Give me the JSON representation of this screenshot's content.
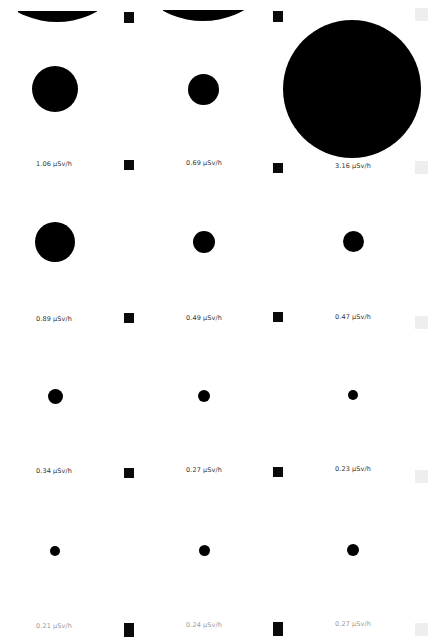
{
  "sheet": {
    "background": "#ffffff",
    "dot_color": "#000000",
    "unit": "µSv/h",
    "top_partial_dots": [
      {
        "clip": {
          "left": 18,
          "top": 11,
          "width": 79,
          "height": 12
        },
        "cx": 57,
        "cy": -60,
        "d": 164
      },
      {
        "clip": {
          "left": 163,
          "top": 10,
          "width": 81,
          "height": 12
        },
        "cx": 203,
        "cy": -62,
        "d": 166
      }
    ],
    "rows": [
      {
        "cells": [
          {
            "value": "1.06 µSv/h",
            "cx": 55,
            "cy": 89,
            "d": 46,
            "label_x": 36,
            "label_y": 160
          },
          {
            "value": "0.69 µSv/h",
            "cx": 203,
            "cy": 89,
            "d": 31,
            "label_x": 186,
            "label_y": 159
          },
          {
            "value": "3.16 µSv/h",
            "cx": 352,
            "cy": 89,
            "d": 138,
            "label_x": 335,
            "label_y": 162
          }
        ]
      },
      {
        "cells": [
          {
            "value": "0.89 µSv/h",
            "cx": 55,
            "cy": 242,
            "d": 40,
            "label_x": 36,
            "label_y": 315
          },
          {
            "value": "0.49 µSv/h",
            "cx": 204,
            "cy": 242,
            "d": 22,
            "label_x": 186,
            "label_y": 314
          },
          {
            "value": "0.47 µSv/h",
            "cx": 353,
            "cy": 241,
            "d": 21,
            "label_x": 335,
            "label_y": 313
          }
        ]
      },
      {
        "cells": [
          {
            "value": "0.34 µSv/h",
            "cx": 55,
            "cy": 396,
            "d": 15,
            "label_x": 36,
            "label_y": 467
          },
          {
            "value": "0.27 µSv/h",
            "cx": 204,
            "cy": 396,
            "d": 12,
            "label_x": 186,
            "label_y": 466
          },
          {
            "value": "0.23 µSv/h",
            "cx": 353,
            "cy": 395,
            "d": 10,
            "label_x": 335,
            "label_y": 465
          }
        ]
      },
      {
        "cells": [
          {
            "value": "0.21 µSv/h",
            "cx": 55,
            "cy": 551,
            "d": 10,
            "label_x": 36,
            "label_y": 622,
            "faded": true
          },
          {
            "value": "0.24 µSv/h",
            "cx": 204,
            "cy": 550,
            "d": 11,
            "label_x": 186,
            "label_y": 621,
            "faded": true
          },
          {
            "value": "0.27 µSv/h",
            "cx": 353,
            "cy": 550,
            "d": 12,
            "label_x": 335,
            "label_y": 620,
            "faded": true
          }
        ]
      }
    ],
    "registration_marks": [
      {
        "x": 124,
        "y": 12,
        "h": 11
      },
      {
        "x": 273,
        "y": 11,
        "h": 11
      },
      {
        "x": 124,
        "y": 160,
        "h": 10
      },
      {
        "x": 273,
        "y": 163,
        "h": 10
      },
      {
        "x": 124,
        "y": 313,
        "h": 10
      },
      {
        "x": 273,
        "y": 312,
        "h": 10
      },
      {
        "x": 124,
        "y": 468,
        "h": 10
      },
      {
        "x": 273,
        "y": 467,
        "h": 10
      },
      {
        "x": 124,
        "y": 623,
        "h": 14
      },
      {
        "x": 273,
        "y": 622,
        "h": 14
      }
    ],
    "edge_tabs": [
      {
        "y": 8
      },
      {
        "y": 161
      },
      {
        "y": 316
      },
      {
        "y": 470
      },
      {
        "y": 623
      }
    ]
  }
}
